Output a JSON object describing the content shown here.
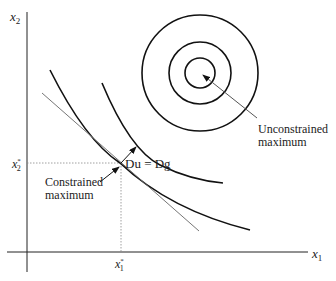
{
  "axes": {
    "x_label": "x",
    "x_label_sub": "1",
    "y_label": "x",
    "y_label_sub": "2"
  },
  "optimum": {
    "x_star_label": "x",
    "x_star_sub": "1",
    "x_star_sup": "*",
    "y_star_label": "x",
    "y_star_sub": "2",
    "y_star_sup": "*"
  },
  "annotations": {
    "gradient_condition": "Du = Dg",
    "constrained_line1": "Constrained",
    "constrained_line2": "maximum",
    "unconstrained_line1": "Unconstrained",
    "unconstrained_line2": "maximum"
  },
  "colors": {
    "curve": "#111111",
    "tangent": "#666666",
    "guide": "#888888",
    "text": "#222222"
  }
}
